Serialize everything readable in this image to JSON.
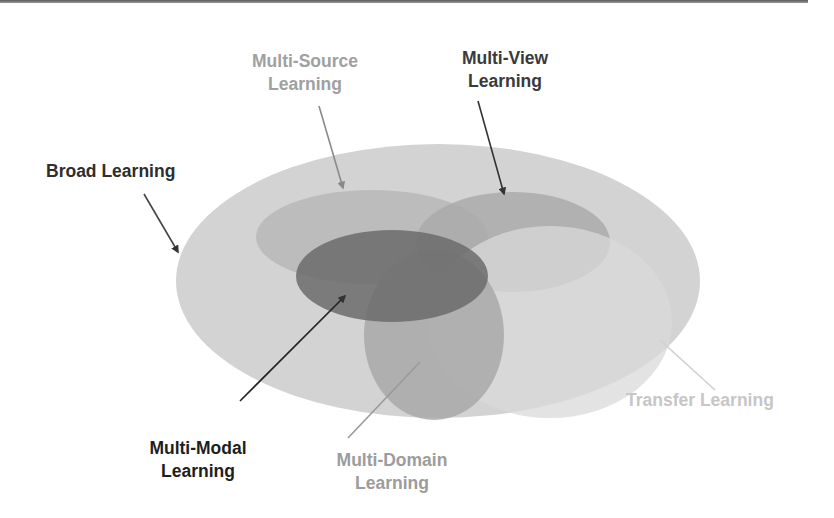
{
  "diagram": {
    "type": "nested-venn",
    "regions": [
      {
        "id": "broad",
        "name": "Broad Learning",
        "lines": [
          "Broad Learning"
        ],
        "color": "#d3d3d3",
        "text_color": "#2e2e2e",
        "ellipse": {
          "cx": 438,
          "cy": 281,
          "rx": 262,
          "ry": 137
        }
      },
      {
        "id": "multi_source",
        "name": "Multi-Source Learning",
        "lines": [
          "Multi-Source",
          "Learning"
        ],
        "color": "#b6b6b6",
        "text_color": "#a3a3a3",
        "ellipse": {
          "cx": 372,
          "cy": 237,
          "rx": 116,
          "ry": 47
        }
      },
      {
        "id": "multi_view",
        "name": "Multi-View Learning",
        "lines": [
          "Multi-View",
          "Learning"
        ],
        "color": "#a9a9a9",
        "text_color": "#3a3a3a",
        "ellipse": {
          "cx": 513,
          "cy": 242,
          "rx": 97,
          "ry": 50
        }
      },
      {
        "id": "transfer",
        "name": "Transfer Learning",
        "lines": [
          "Transfer Learning"
        ],
        "color": "#dadada",
        "text_color": "#c8c8c8",
        "ellipse": {
          "cx": 550,
          "cy": 322,
          "rx": 122,
          "ry": 96
        }
      },
      {
        "id": "multi_domain",
        "name": "Multi-Domain Learning",
        "lines": [
          "Multi-Domain",
          "Learning"
        ],
        "color": "#a6a6a6",
        "text_color": "#9c9c9c",
        "ellipse": {
          "cx": 434,
          "cy": 335,
          "rx": 70,
          "ry": 85
        }
      },
      {
        "id": "multi_modal",
        "name": "Multi-Modal Learning",
        "lines": [
          "Multi-Modal",
          "Learning"
        ],
        "color": "#6b6b6b",
        "text_color": "#1e1e1e",
        "ellipse": {
          "cx": 392,
          "cy": 276,
          "rx": 96,
          "ry": 46
        }
      }
    ],
    "labels": {
      "broad": {
        "line1": "Broad Learning"
      },
      "multi_source": {
        "line1": "Multi-Source",
        "line2": "Learning"
      },
      "multi_view": {
        "line1": "Multi-View",
        "line2": "Learning"
      },
      "transfer": {
        "line1": "Transfer Learning"
      },
      "multi_domain": {
        "line1": "Multi-Domain",
        "line2": "Learning"
      },
      "multi_modal": {
        "line1": "Multi-Modal",
        "line2": "Learning"
      }
    },
    "arrows": [
      {
        "from": "broad",
        "x1": 144,
        "y1": 194,
        "x2": 178,
        "y2": 252,
        "color": "#444444",
        "head": true
      },
      {
        "from": "multi_source",
        "x1": 319,
        "y1": 106,
        "x2": 343,
        "y2": 188,
        "color": "#8a8a8a",
        "head": true
      },
      {
        "from": "multi_view",
        "x1": 478,
        "y1": 101,
        "x2": 504,
        "y2": 194,
        "color": "#333333",
        "head": true
      },
      {
        "from": "multi_modal",
        "x1": 240,
        "y1": 401,
        "x2": 345,
        "y2": 296,
        "color": "#222222",
        "head": true
      },
      {
        "from": "multi_domain",
        "x1": 348,
        "y1": 438,
        "x2": 420,
        "y2": 362,
        "color": "#9a9a9a",
        "head": false
      },
      {
        "from": "transfer",
        "x1": 660,
        "y1": 340,
        "x2": 715,
        "y2": 390,
        "color": "#d0d0d0",
        "head": false
      }
    ]
  }
}
